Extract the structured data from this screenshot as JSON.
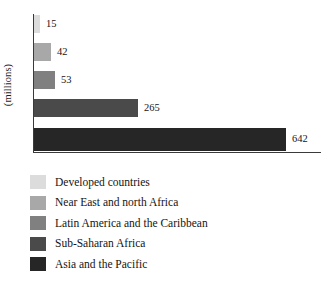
{
  "chart_data": {
    "type": "bar",
    "orientation": "horizontal",
    "title": "",
    "xlabel": "",
    "ylabel": "(millions)",
    "grid": false,
    "legend_position": "bottom",
    "xlim": [
      0,
      642
    ],
    "categories": [
      "Developed countries",
      "Near East and north Africa",
      "Latin America and the Caribbean",
      "Sub-Saharan Africa",
      "Asia and the Pacific"
    ],
    "values": [
      15,
      42,
      53,
      265,
      642
    ],
    "value_labels": [
      "15",
      "42",
      "53",
      "265",
      "642"
    ],
    "colors": [
      "#dcdcdc",
      "#a8a8a8",
      "#808080",
      "#4a4a4a",
      "#262626"
    ]
  },
  "axis": {
    "y_title": "(millions)"
  },
  "bars": [
    {
      "label": "Developed countries",
      "value": "15",
      "color": "#dcdcdc",
      "width_px": "6px"
    },
    {
      "label": "Near East and north Africa",
      "value": "42",
      "color": "#a8a8a8",
      "width_px": "17px"
    },
    {
      "label": "Latin America and the Caribbean",
      "value": "53",
      "color": "#808080",
      "width_px": "21px"
    },
    {
      "label": "Sub-Saharan Africa",
      "value": "265",
      "color": "#4a4a4a",
      "width_px": "104px"
    },
    {
      "label": "Asia and the Pacific",
      "value": "642",
      "color": "#262626",
      "width_px": "252px"
    }
  ],
  "legend": {
    "items": [
      {
        "label": "Developed countries",
        "color": "#dcdcdc"
      },
      {
        "label": "Near East and north Africa",
        "color": "#a8a8a8"
      },
      {
        "label": "Latin America and the Caribbean",
        "color": "#808080"
      },
      {
        "label": "Sub-Saharan Africa",
        "color": "#4a4a4a"
      },
      {
        "label": "Asia and the Pacific",
        "color": "#262626"
      }
    ]
  }
}
